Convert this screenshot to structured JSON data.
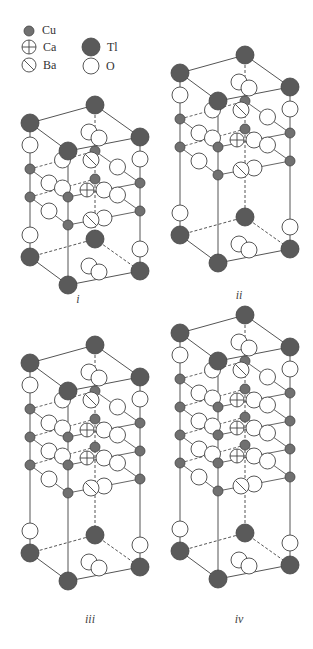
{
  "legend": {
    "items": [
      {
        "key": "cu",
        "label": "Cu",
        "symbol": "small-filled"
      },
      {
        "key": "ca",
        "label": "Ca",
        "symbol": "crossed-circle"
      },
      {
        "key": "tl",
        "label": "Tl",
        "symbol": "large-filled"
      },
      {
        "key": "ba",
        "label": "Ba",
        "symbol": "slashed-circle"
      },
      {
        "key": "o",
        "label": "O",
        "symbol": "open-circle"
      }
    ]
  },
  "colors": {
    "tl_fill": "#5a5a5a",
    "cu_fill": "#707070",
    "outline": "#444444",
    "bond": "#555555",
    "background": "#ffffff"
  },
  "panels": [
    {
      "id": "i",
      "caption": "i",
      "layers": 1
    },
    {
      "id": "ii",
      "caption": "ii",
      "layers": 2
    },
    {
      "id": "iii",
      "caption": "iii",
      "layers": 3
    },
    {
      "id": "iv",
      "caption": "iv",
      "layers": 4
    }
  ]
}
